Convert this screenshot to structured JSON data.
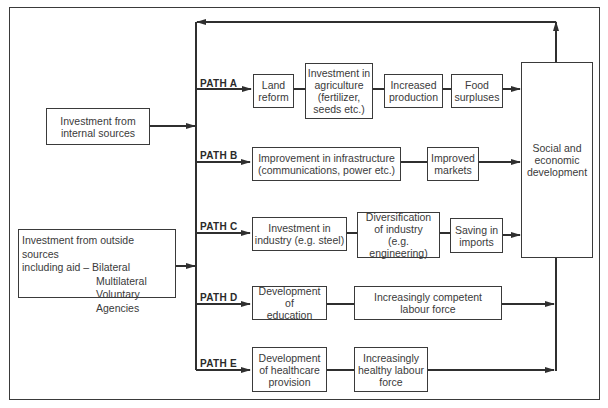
{
  "diagram": {
    "sources": {
      "internal": {
        "lines": [
          "Investment from",
          "internal sources"
        ]
      },
      "outside": {
        "line1": "Investment from outside sources",
        "line2": "including aid – Bilateral",
        "aid_types": [
          "Multilateral",
          "Voluntary",
          "Agencies"
        ]
      }
    },
    "paths": [
      {
        "label": "PATH A",
        "steps": [
          {
            "lines": [
              "Land",
              "reform"
            ]
          },
          {
            "lines": [
              "Investment in",
              "agriculture",
              "(fertilizer,",
              "seeds etc.)"
            ]
          },
          {
            "lines": [
              "Increased",
              "production"
            ]
          },
          {
            "lines": [
              "Food",
              "surpluses"
            ]
          }
        ]
      },
      {
        "label": "PATH B",
        "steps": [
          {
            "lines": [
              "Improvement in infrastructure",
              "(communications, power etc.)"
            ]
          },
          {
            "lines": [
              "Improved",
              "markets"
            ]
          }
        ]
      },
      {
        "label": "PATH C",
        "steps": [
          {
            "lines": [
              "Investment in",
              "industry (e.g. steel)"
            ]
          },
          {
            "lines": [
              "Diversification",
              "of industry",
              "(e.g. engineering)"
            ]
          },
          {
            "lines": [
              "Saving in",
              "imports"
            ]
          }
        ]
      },
      {
        "label": "PATH D",
        "steps": [
          {
            "lines": [
              "Development of",
              "education"
            ]
          },
          {
            "lines": [
              "Increasingly competent",
              "labour force"
            ]
          }
        ]
      },
      {
        "label": "PATH E",
        "steps": [
          {
            "lines": [
              "Development",
              "of healthcare",
              "provision"
            ]
          },
          {
            "lines": [
              "Increasingly",
              "healthy labour",
              "force"
            ]
          }
        ]
      }
    ],
    "outcome": {
      "lines": [
        "Social and",
        "economic",
        "development"
      ]
    },
    "colors": {
      "line": "#2f2f2f",
      "box_border": "#3a3a3a",
      "background": "#ffffff"
    }
  }
}
